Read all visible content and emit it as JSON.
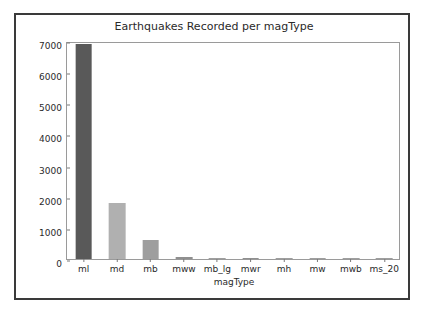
{
  "chart_data": {
    "type": "bar",
    "title": "Earthquakes Recorded per magType",
    "xlabel": "magType",
    "ylabel": "earthquakes",
    "categories": [
      "ml",
      "md",
      "mb",
      "mww",
      "mb_lg",
      "mwr",
      "mh",
      "mw",
      "mwb",
      "ms_20"
    ],
    "values": [
      6900,
      1800,
      600,
      50,
      10,
      30,
      2,
      2,
      2,
      1
    ],
    "ylim": [
      0,
      7000
    ],
    "yticks": [
      0,
      1000,
      2000,
      3000,
      4000,
      5000,
      6000,
      7000
    ],
    "ytick_labels": [
      "0",
      "1000",
      "2000",
      "3000",
      "4000",
      "5000",
      "6000",
      "7000"
    ],
    "grid": false,
    "legend": null,
    "bar_colors": [
      "#595959",
      "#b0b0b0",
      "#9e9e9e",
      "#8f8f8f",
      "#9e9e9e",
      "#8f8f8f",
      "#9e9e9e",
      "#9e9e9e",
      "#9e9e9e",
      "#9e9e9e"
    ],
    "bar_edge_color": "#8a8a8a",
    "axes_color": "#9a9a9a",
    "text_color": "#2a2a2a",
    "background": "#ffffff",
    "frame_color": "#3a3a3a"
  }
}
